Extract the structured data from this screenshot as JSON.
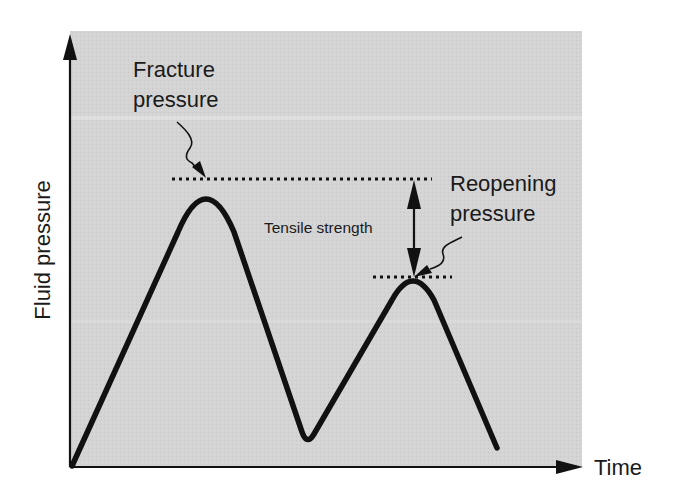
{
  "diagram": {
    "type": "schematic-line",
    "background_color": "#d6d6d6",
    "line_color": "#111111",
    "axes": {
      "y_label": "Fluid pressure",
      "x_label": "Time"
    },
    "annotations": {
      "fracture_pressure": [
        "Fracture",
        "pressure"
      ],
      "reopening_pressure": [
        "Reopening",
        "pressure"
      ],
      "tensile_strength": "Tensile strength"
    },
    "curve_points": [
      {
        "label": "start",
        "x": 72,
        "y": 466
      },
      {
        "label": "fracture-peak",
        "x": 206,
        "y": 180
      },
      {
        "label": "valley",
        "x": 307,
        "y": 441
      },
      {
        "label": "reopening-peak",
        "x": 413,
        "y": 278
      },
      {
        "label": "end",
        "x": 497,
        "y": 448
      }
    ]
  }
}
